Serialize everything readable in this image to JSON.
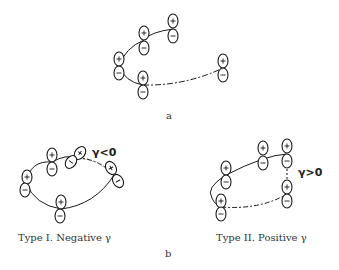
{
  "figure": {
    "panel_a": {
      "label": "a"
    },
    "panel_b": {
      "label": "b",
      "type1": {
        "caption": "Type I. Negative γ",
        "condition": "γ<0"
      },
      "type2": {
        "caption": "Type II. Positive γ",
        "condition": "γ>0"
      }
    },
    "orbital_signs": {
      "plus": "+",
      "minus": "−"
    },
    "colors": {
      "line": "#1a1a1a",
      "background": "#ffffff"
    }
  }
}
